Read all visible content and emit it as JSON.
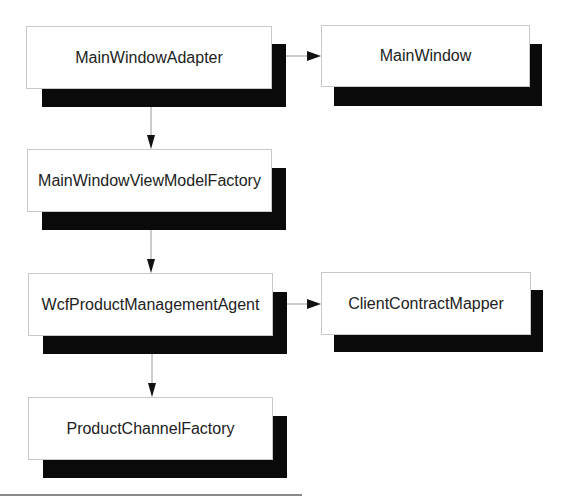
{
  "diagram": {
    "type": "dependency-flow",
    "style": {
      "box_fill": "#ffffff",
      "box_border": "#c8c8c8",
      "shadow_color": "#0a0a0a",
      "text_color": "#222222",
      "connector_color": "#9a9a9a",
      "arrowhead_color": "#111111"
    },
    "nodes": [
      {
        "id": "main-window-adapter",
        "label": "MainWindowAdapter"
      },
      {
        "id": "main-window",
        "label": "MainWindow"
      },
      {
        "id": "main-window-view-model-factory",
        "label": "MainWindowViewModelFactory"
      },
      {
        "id": "wcf-product-management-agent",
        "label": "WcfProductManagementAgent"
      },
      {
        "id": "client-contract-mapper",
        "label": "ClientContractMapper"
      },
      {
        "id": "product-channel-factory",
        "label": "ProductChannelFactory"
      }
    ],
    "edges": [
      {
        "from": "MainWindowAdapter",
        "to": "MainWindow"
      },
      {
        "from": "MainWindowAdapter",
        "to": "MainWindowViewModelFactory"
      },
      {
        "from": "MainWindowViewModelFactory",
        "to": "WcfProductManagementAgent"
      },
      {
        "from": "WcfProductManagementAgent",
        "to": "ClientContractMapper"
      },
      {
        "from": "WcfProductManagementAgent",
        "to": "ProductChannelFactory"
      }
    ]
  }
}
